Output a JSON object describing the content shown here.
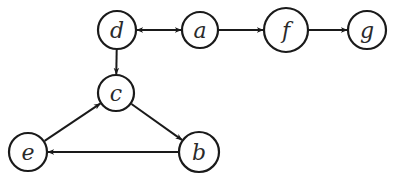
{
  "diagram": {
    "type": "directed-graph",
    "colors": {
      "stroke": "#1a1a1a",
      "fill": "#ffffff",
      "text": "#2a2a2a"
    },
    "nodes": [
      {
        "id": "d",
        "label": "d",
        "x": 117,
        "y": 30,
        "r": 19
      },
      {
        "id": "a",
        "label": "a",
        "x": 200,
        "y": 30,
        "r": 18
      },
      {
        "id": "f",
        "label": "f",
        "x": 286,
        "y": 30,
        "r": 22
      },
      {
        "id": "g",
        "label": "g",
        "x": 367,
        "y": 30,
        "r": 19
      },
      {
        "id": "c",
        "label": "c",
        "x": 116,
        "y": 93,
        "r": 18
      },
      {
        "id": "e",
        "label": "e",
        "x": 28,
        "y": 152,
        "r": 19
      },
      {
        "id": "b",
        "label": "b",
        "x": 199,
        "y": 152,
        "r": 20
      }
    ],
    "edges": [
      {
        "from": "d",
        "to": "a",
        "bidirectional": true
      },
      {
        "from": "a",
        "to": "f",
        "bidirectional": false
      },
      {
        "from": "f",
        "to": "g",
        "bidirectional": false
      },
      {
        "from": "d",
        "to": "c",
        "bidirectional": false
      },
      {
        "from": "c",
        "to": "b",
        "bidirectional": false
      },
      {
        "from": "b",
        "to": "e",
        "bidirectional": false
      },
      {
        "from": "e",
        "to": "c",
        "bidirectional": false
      }
    ]
  }
}
